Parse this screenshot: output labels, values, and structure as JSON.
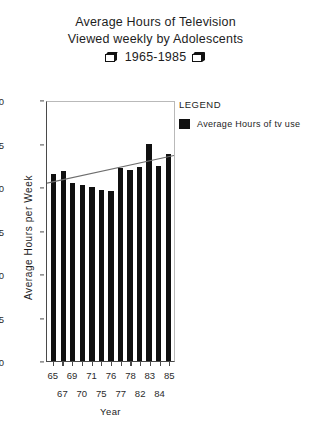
{
  "title": {
    "line1": "Average Hours of Television",
    "line2": "Viewed weekly by Adolescents",
    "line3": "1965-1985"
  },
  "legend": {
    "header": "LEGEND",
    "series_label": "Average Hours of tv use",
    "swatch_color": "#101010"
  },
  "axis": {
    "y_label": "Average Hours per Week",
    "x_label": "Year",
    "y_ticks": [
      "0",
      "5",
      "10",
      "15",
      "20",
      "25",
      "30"
    ],
    "x_labels_top": [
      "65",
      "69",
      "71",
      "76",
      "78",
      "83",
      "85"
    ],
    "x_labels_bottom": [
      "67",
      "70",
      "75",
      "77",
      "82",
      "84"
    ]
  },
  "chart_data": {
    "type": "bar",
    "title": "Average Hours of Television Viewed weekly by Adolescents 1965-1985",
    "xlabel": "Year",
    "ylabel": "Average Hours per Week",
    "categories": [
      "65",
      "67",
      "69",
      "70",
      "71",
      "75",
      "76",
      "77",
      "78",
      "82",
      "83",
      "84",
      "85"
    ],
    "values": [
      21.5,
      21.8,
      20.5,
      20.2,
      20.0,
      19.7,
      19.5,
      22.2,
      22.0,
      22.3,
      25.0,
      22.4,
      23.8
    ],
    "series": [
      {
        "name": "Average Hours of tv use",
        "values": [
          21.5,
          21.8,
          20.5,
          20.2,
          20.0,
          19.7,
          19.5,
          22.2,
          22.0,
          22.3,
          25.0,
          22.4,
          23.8
        ],
        "color": "#101010"
      }
    ],
    "trendline": {
      "name": "linear trend",
      "y_start": 20.6,
      "y_end": 23.8,
      "color": "#6e6e6e"
    },
    "ylim": [
      0,
      30
    ],
    "ytick_step": 5,
    "grid": false,
    "legend_position": "right",
    "bar_color": "#101010"
  }
}
